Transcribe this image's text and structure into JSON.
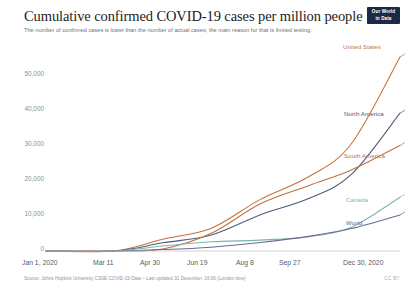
{
  "header": {
    "title": "Cumulative confirmed COVID-19 cases per million people",
    "subtitle": "The number of confirmed cases is lower than the number of actual cases; the main reason for that is limited testing.",
    "logo_line1": "Our World",
    "logo_line2": "in Data"
  },
  "footer": {
    "source": "Source: Johns Hopkins University CSSE COVID-19 Data – Last updated 31 December, 16:06 (London time)",
    "license": "CC BY"
  },
  "colors": {
    "united_states": "#c8713a",
    "north_america": "#4c5c77",
    "south_america": "#c0703f",
    "canada": "#7cb5ae",
    "world": "#6b6b92",
    "axis": "#b7bbc0",
    "tick_text": "#8b9096",
    "xtick_text": "#575c61",
    "title": "#1d1d1d",
    "subtitle": "#6b7075",
    "logo_bg": "#1d2a46"
  },
  "chart_data": {
    "type": "line",
    "title": "Cumulative confirmed COVID-19 cases per million people",
    "subtitle": "The number of confirmed cases is lower than the number of actual cases; the main reason for that is limited testing.",
    "xlabel": "",
    "ylabel": "",
    "ylim": [
      0,
      57000
    ],
    "yticks": [
      0,
      10000,
      20000,
      30000,
      40000,
      50000
    ],
    "ytick_labels": [
      "0",
      "10,000",
      "20,000",
      "30,000",
      "40,000",
      "50,000"
    ],
    "xticks": [
      "Jan 1, 2020",
      "Mar 11",
      "Apr 30",
      "Jun 19",
      "Aug 8",
      "Sep 27",
      "Dec 30, 2020"
    ],
    "x_dates": [
      "2020-01-01",
      "2020-03-11",
      "2020-04-30",
      "2020-06-19",
      "2020-08-08",
      "2020-09-27",
      "2020-12-30"
    ],
    "grid": false,
    "legend": "annotated-line-ends",
    "series": [
      {
        "name": "United States",
        "color": "#c8713a",
        "label_pos": "end",
        "x": [
          "2020-01-01",
          "2020-03-11",
          "2020-04-30",
          "2020-06-19",
          "2020-08-08",
          "2020-09-27",
          "2020-11-10",
          "2020-12-30"
        ],
        "values": [
          0,
          12,
          3450,
          6700,
          15100,
          21800,
          31500,
          57000
        ]
      },
      {
        "name": "North America",
        "color": "#4c5c77",
        "label_pos": "end",
        "x": [
          "2020-01-01",
          "2020-03-11",
          "2020-04-30",
          "2020-06-19",
          "2020-08-08",
          "2020-09-27",
          "2020-11-10",
          "2020-12-30"
        ],
        "values": [
          0,
          8,
          2400,
          4700,
          10600,
          15400,
          22500,
          40500
        ]
      },
      {
        "name": "South America",
        "color": "#c0703f",
        "label_pos": "end",
        "x": [
          "2020-01-01",
          "2020-03-11",
          "2020-04-30",
          "2020-06-19",
          "2020-08-08",
          "2020-09-27",
          "2020-11-10",
          "2020-12-30"
        ],
        "values": [
          0,
          2,
          600,
          5200,
          13800,
          19200,
          23800,
          31000
        ]
      },
      {
        "name": "Canada",
        "color": "#7cb5ae",
        "label_pos": "end",
        "x": [
          "2020-01-01",
          "2020-03-11",
          "2020-04-30",
          "2020-06-19",
          "2020-08-08",
          "2020-09-27",
          "2020-11-10",
          "2020-12-30"
        ],
        "values": [
          0,
          3,
          1450,
          2700,
          3200,
          4200,
          7000,
          15800
        ]
      },
      {
        "name": "World",
        "color": "#6b6b92",
        "label_pos": "end",
        "x": [
          "2020-01-01",
          "2020-03-11",
          "2020-04-30",
          "2020-06-19",
          "2020-08-08",
          "2020-09-27",
          "2020-11-10",
          "2020-12-30"
        ],
        "values": [
          0,
          16,
          420,
          1130,
          2500,
          4300,
          6600,
          10600
        ]
      }
    ]
  },
  "axes": {
    "yticks": [
      {
        "label": "50,000"
      },
      {
        "label": "40,000"
      },
      {
        "label": "30,000"
      },
      {
        "label": "20,000"
      },
      {
        "label": "10,000"
      },
      {
        "label": "0"
      }
    ],
    "xticks": [
      {
        "label": "Jan 1, 2020"
      },
      {
        "label": "Mar 11"
      },
      {
        "label": "Apr 30"
      },
      {
        "label": "Jun 19"
      },
      {
        "label": "Aug 8"
      },
      {
        "label": "Sep 27"
      },
      {
        "label": "Dec 30, 2020"
      }
    ]
  },
  "series_labels": [
    {
      "name": "United States"
    },
    {
      "name": "North America"
    },
    {
      "name": "South America"
    },
    {
      "name": "Canada"
    },
    {
      "name": "World"
    }
  ]
}
